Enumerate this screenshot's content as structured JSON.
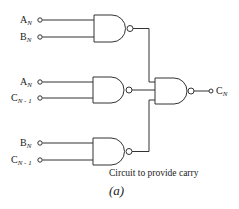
{
  "diagram": {
    "type": "logic-circuit",
    "caption": "Circuit to provide carry",
    "figure_label": "(a)",
    "line_color": "#333333",
    "gates": [
      {
        "id": "nand-1",
        "type": "NAND",
        "inputs": [
          "A_N",
          "B_N"
        ]
      },
      {
        "id": "nand-2",
        "type": "NAND",
        "inputs": [
          "A_N",
          "C_N-1"
        ]
      },
      {
        "id": "nand-3",
        "type": "NAND",
        "inputs": [
          "B_N",
          "C_N-1"
        ]
      },
      {
        "id": "nand-out",
        "type": "NAND",
        "inputs": [
          "nand-1",
          "nand-2",
          "nand-3"
        ],
        "output": "C_N"
      }
    ],
    "inputs": [
      {
        "base": "A",
        "sub": "N"
      },
      {
        "base": "B",
        "sub": "N"
      },
      {
        "base": "A",
        "sub": "N"
      },
      {
        "base": "C",
        "sub": "N - 1"
      },
      {
        "base": "B",
        "sub": "N"
      },
      {
        "base": "C",
        "sub": "N - 1"
      }
    ],
    "output": {
      "base": "C",
      "sub": "N"
    }
  }
}
